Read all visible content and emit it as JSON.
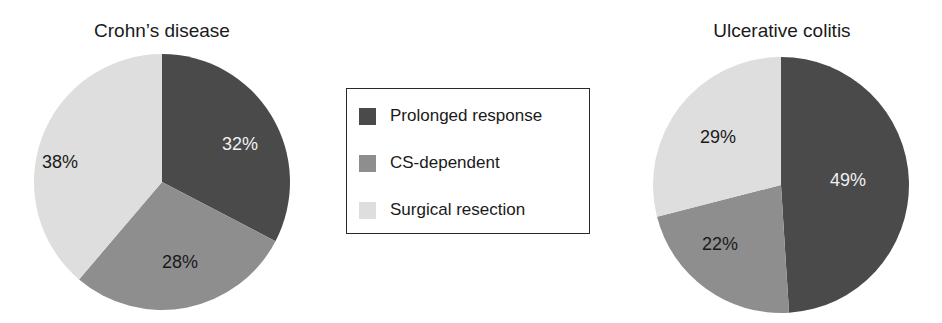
{
  "legend": {
    "items": [
      {
        "label": "Prolonged response",
        "color": "#4a4a4a"
      },
      {
        "label": "CS-dependent",
        "color": "#8e8e8e"
      },
      {
        "label": "Surgical resection",
        "color": "#dedede"
      }
    ]
  },
  "charts": [
    {
      "title": "Crohn’s disease",
      "labels": [
        "32%",
        "28%",
        "38%"
      ]
    },
    {
      "title": "Ulcerative colitis",
      "labels": [
        "49%",
        "22%",
        "29%"
      ]
    }
  ],
  "chart_data": [
    {
      "type": "pie",
      "title": "Crohn’s disease",
      "categories": [
        "Prolonged response",
        "CS-dependent",
        "Surgical resection"
      ],
      "values": [
        32,
        28,
        38
      ],
      "unit": "%",
      "colors": [
        "#4a4a4a",
        "#8e8e8e",
        "#dedede"
      ],
      "legend_position": "center between charts"
    },
    {
      "type": "pie",
      "title": "Ulcerative colitis",
      "categories": [
        "Prolonged response",
        "CS-dependent",
        "Surgical resection"
      ],
      "values": [
        49,
        22,
        29
      ],
      "unit": "%",
      "colors": [
        "#4a4a4a",
        "#8e8e8e",
        "#dedede"
      ],
      "legend_position": "center between charts"
    }
  ]
}
